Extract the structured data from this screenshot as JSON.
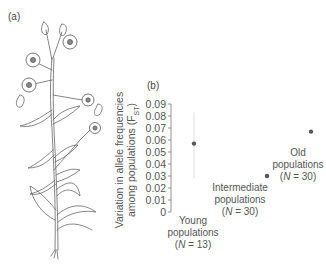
{
  "figure": {
    "panel_a_label": "(a)",
    "panel_b_label": "(b)",
    "illustration": "flowering-plant-drawing"
  },
  "chart_data": {
    "type": "scatter",
    "title": "",
    "xlabel": "",
    "ylabel": "Variation in allele frequencies among populations (F_ST)",
    "ylabel_line1": "Variation in allele frequencies",
    "ylabel_line2": "among populations (F",
    "ylabel_sub": "ST",
    "ylim": [
      0,
      0.09
    ],
    "yticks": [
      "0",
      "0.01",
      "0.02",
      "0.03",
      "0.04",
      "0.05",
      "0.06",
      "0.07",
      "0.08",
      "0.09"
    ],
    "grid": false,
    "categories": [
      {
        "name": "Young populations",
        "line1": "Young",
        "line2": "populations",
        "n_label": "(N = 13)",
        "n": 13
      },
      {
        "name": "Intermediate populations",
        "line1": "Intermediate",
        "line2": "populations",
        "n_label": "(N = 30)",
        "n": 30
      },
      {
        "name": "Old populations",
        "line1": "Old",
        "line2": "populations",
        "n_label": "(N = 30)",
        "n": 30
      }
    ],
    "values": [
      0.057,
      0.03,
      0.067
    ],
    "error_bars": [
      [
        0.028,
        0.083
      ],
      null,
      null
    ]
  }
}
